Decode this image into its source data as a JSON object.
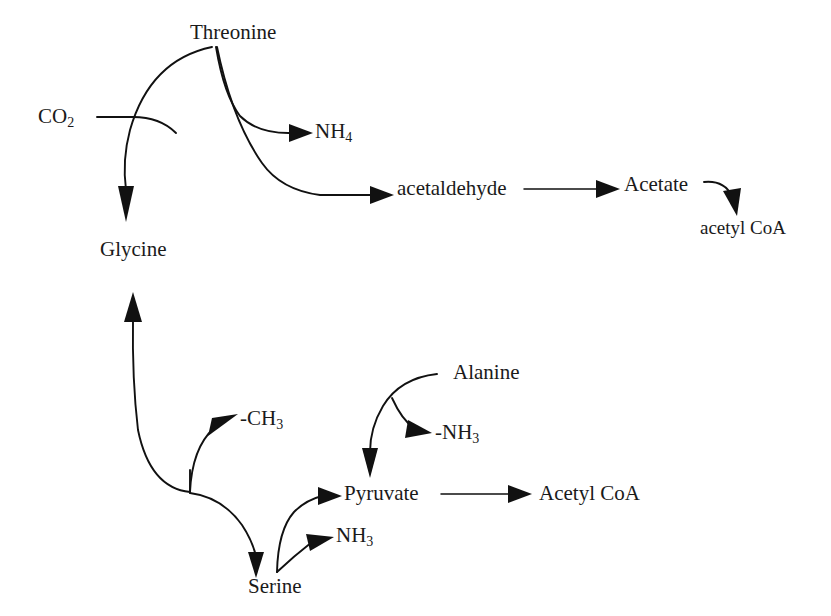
{
  "diagram": {
    "background_color": "#ffffff",
    "line_color": "#111111",
    "text_color": "#1a1a1a",
    "nodes": {
      "threonine": "Threonine",
      "co2": "CO",
      "co2_sub": "2",
      "glycine": "Glycine",
      "nh4": "NH",
      "nh4_sub": "4",
      "acetaldehyde": "acetaldehyde",
      "acetate": "Acetate",
      "acetyl_coa_lower": "acetyl CoA",
      "serine": "Serine",
      "methyl": "-CH",
      "methyl_sub": "3",
      "pyruvate": "Pyruvate",
      "nh3_serine": "NH",
      "nh3_serine_sub": "3",
      "alanine": "Alanine",
      "minus_nh3": "-NH",
      "minus_nh3_sub": "3",
      "acetyl_coa_right": "Acetyl CoA"
    },
    "edges": [
      {
        "id": "co2-to-glycine",
        "from": "CO2",
        "to": "Glycine",
        "type": "curved-arrow"
      },
      {
        "id": "threonine-to-glycine",
        "from": "Threonine",
        "to": "Glycine",
        "type": "curved-arrow"
      },
      {
        "id": "threonine-to-nh4",
        "from": "Threonine",
        "to": "NH4",
        "type": "curved-arrow"
      },
      {
        "id": "threonine-to-acetaldehyde",
        "from": "Threonine",
        "to": "acetaldehyde",
        "type": "curved-arrow"
      },
      {
        "id": "acetaldehyde-to-acetate",
        "from": "acetaldehyde",
        "to": "Acetate",
        "type": "straight-arrow"
      },
      {
        "id": "acetate-to-acetyl-coa",
        "from": "Acetate",
        "to": "acetyl CoA",
        "type": "curved-arrow"
      },
      {
        "id": "serine-to-glycine",
        "from": "Serine",
        "to": "Glycine",
        "type": "curved-arrow"
      },
      {
        "id": "serine-to-methyl",
        "from": "Serine",
        "to": "-CH3",
        "type": "curved-arrow"
      },
      {
        "id": "serine-to-pyruvate",
        "from": "Serine",
        "to": "Pyruvate",
        "type": "curved-arrow"
      },
      {
        "id": "serine-to-nh3",
        "from": "Serine",
        "to": "NH3",
        "type": "curved-arrow"
      },
      {
        "id": "alanine-to-pyruvate",
        "from": "Alanine",
        "to": "Pyruvate",
        "type": "curved-arrow"
      },
      {
        "id": "alanine-to-minus-nh3",
        "from": "Alanine",
        "to": "-NH3",
        "type": "curved-arrow"
      },
      {
        "id": "pyruvate-to-acetyl-coa",
        "from": "Pyruvate",
        "to": "Acetyl CoA",
        "type": "straight-arrow"
      }
    ]
  }
}
